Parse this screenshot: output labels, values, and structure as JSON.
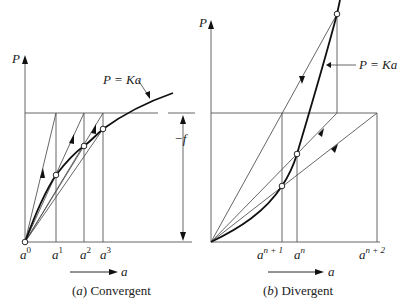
{
  "figure": {
    "panels": [
      {
        "id": "a",
        "caption_letter": "a",
        "caption_text": "Convergent",
        "y_axis_label": "P",
        "x_axis_label": "a",
        "curve_label": "P = Ka",
        "dimension_label": "−f",
        "x_ticks": [
          {
            "base": "a",
            "sup": "0"
          },
          {
            "base": "a",
            "sup": "1"
          },
          {
            "base": "a",
            "sup": "2"
          },
          {
            "base": "a",
            "sup": "3"
          }
        ]
      },
      {
        "id": "b",
        "caption_letter": "b",
        "caption_text": "Divergent",
        "y_axis_label": "P",
        "x_axis_label": "a",
        "curve_label": "P = Ka",
        "x_ticks": [
          {
            "base": "a",
            "sup": "n + 1"
          },
          {
            "base": "a",
            "sup": "n"
          },
          {
            "base": "a",
            "sup": "n + 2"
          }
        ]
      }
    ]
  },
  "colors": {
    "thin_line": "#555555",
    "curve": "#111111",
    "text": "#222222"
  }
}
